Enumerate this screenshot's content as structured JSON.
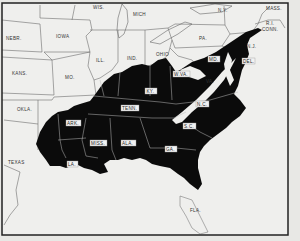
{
  "map": {
    "type": "choropleth-region",
    "description": "Eastern United States with shaded region covering southeastern states",
    "colors": {
      "background": "#ececea",
      "shaded": "#0b0b0b",
      "unshaded": "#efefed",
      "border_line": "#777777",
      "frame": "#222222"
    },
    "unshaded_labels": [
      {
        "id": "wis",
        "text": "WIS.",
        "x": 100,
        "y": 8
      },
      {
        "id": "mich",
        "text": "MICH",
        "x": 142,
        "y": 16
      },
      {
        "id": "ny",
        "text": "N.Y.",
        "x": 222,
        "y": 11
      },
      {
        "id": "mass",
        "text": "MASS.",
        "x": 271,
        "y": 10
      },
      {
        "id": "conn",
        "text": "CONN.",
        "x": 265,
        "y": 30
      },
      {
        "id": "ri",
        "text": "R.I.",
        "x": 268,
        "y": 24
      },
      {
        "id": "nebr",
        "text": "NEBR.",
        "x": 12,
        "y": 39
      },
      {
        "id": "iowa",
        "text": "IOWA",
        "x": 63,
        "y": 37
      },
      {
        "id": "ill",
        "text": "ILL.",
        "x": 99,
        "y": 61
      },
      {
        "id": "ind",
        "text": "IND.",
        "x": 130,
        "y": 59
      },
      {
        "id": "ohio",
        "text": "OHIO",
        "x": 157,
        "y": 55
      },
      {
        "id": "pa",
        "text": "PA.",
        "x": 203,
        "y": 40
      },
      {
        "id": "nj",
        "text": "N.J.",
        "x": 249,
        "y": 49
      },
      {
        "id": "kans",
        "text": "KANS.",
        "x": 15,
        "y": 74
      },
      {
        "id": "mo",
        "text": "MO.",
        "x": 72,
        "y": 78
      },
      {
        "id": "okla",
        "text": "OKLA.",
        "x": 18,
        "y": 110
      },
      {
        "id": "texas",
        "text": "TEXAS",
        "x": 8,
        "y": 163
      },
      {
        "id": "va",
        "text": "VA.",
        "x": 207,
        "y": 82
      },
      {
        "id": "fla",
        "text": "FLA.",
        "x": 196,
        "y": 212
      }
    ],
    "shaded_labels": [
      {
        "id": "ky",
        "text": "KY.",
        "x": 149,
        "y": 92
      },
      {
        "id": "wva",
        "text": "W.VA.",
        "x": 177,
        "y": 73
      },
      {
        "id": "tenn",
        "text": "TENN.",
        "x": 122,
        "y": 109
      },
      {
        "id": "nc",
        "text": "N.C.",
        "x": 199,
        "y": 105
      },
      {
        "id": "sc",
        "text": "S.C.",
        "x": 186,
        "y": 126
      },
      {
        "id": "ark",
        "text": "ARK.",
        "x": 71,
        "y": 123
      },
      {
        "id": "miss",
        "text": "MISS.",
        "x": 93,
        "y": 143
      },
      {
        "id": "ala",
        "text": "ALA.",
        "x": 127,
        "y": 143
      },
      {
        "id": "ga",
        "text": "GA.",
        "x": 166,
        "y": 149
      },
      {
        "id": "la",
        "text": "LA.",
        "x": 70,
        "y": 163
      },
      {
        "id": "md",
        "text": "MD.",
        "x": 211,
        "y": 59
      },
      {
        "id": "del",
        "text": "DEL.",
        "x": 244,
        "y": 62
      }
    ]
  }
}
